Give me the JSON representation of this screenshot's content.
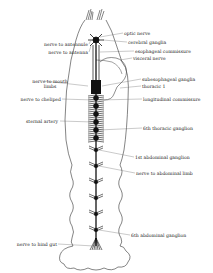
{
  "diagram": {
    "labels_left": [
      {
        "id": "nerve-to-antennule",
        "text": "nerve to antennule"
      },
      {
        "id": "nerve-to-antenna",
        "text": "nerve to antenna"
      },
      {
        "id": "nerve-to-mouth-limbs",
        "text": "nerve to mouth limbs"
      },
      {
        "id": "nerve-to-cheliped",
        "text": "nerve to cheliped"
      },
      {
        "id": "sternal-artery",
        "text": "sternal artery"
      },
      {
        "id": "nerve-to-hind-gut",
        "text": "nerve to hind gut"
      }
    ],
    "labels_right": [
      {
        "id": "optic-nerve",
        "text": "optic nerve"
      },
      {
        "id": "cerebral-ganglia",
        "text": "cerebral ganglia"
      },
      {
        "id": "esophageal-commissure",
        "text": "esophageal commissure"
      },
      {
        "id": "visceral-nerve",
        "text": "visceral nerve"
      },
      {
        "id": "subesophageal-ganglia",
        "text": "subesophageal ganglia"
      },
      {
        "id": "thoracic-1",
        "text": "thoracic 1"
      },
      {
        "id": "longitudinal-commissure",
        "text": "longitudinal commissure"
      },
      {
        "id": "6th-thoracic-ganglion",
        "text": "6th thoracic ganglion"
      },
      {
        "id": "1st-abdominal-ganglion",
        "text": "1st abdominal ganglion"
      },
      {
        "id": "nerve-to-abdominal-limb",
        "text": "nerve to abdominal limb"
      },
      {
        "id": "6th-abdominal-ganglion",
        "text": "6th abdominal ganglion"
      }
    ]
  }
}
